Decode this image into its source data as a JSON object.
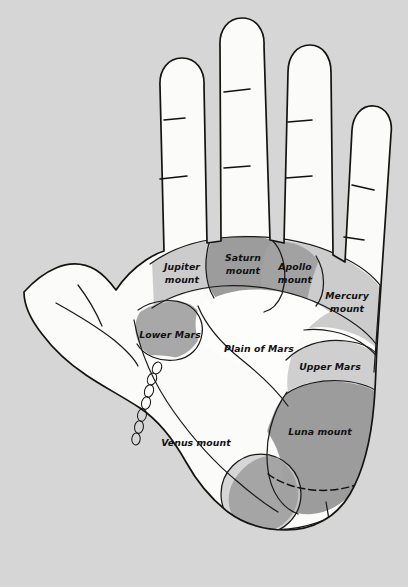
{
  "diagram": {
    "background_color": "#d6d6d6",
    "outline_color": "#15130f",
    "hand": "left palm, fingers up"
  },
  "palette": {
    "background": "#d6d6d6",
    "skin_white": "#fbfbfa",
    "plain_white": "#fdfdfc",
    "light_gray": "#cccccc",
    "medium_gray": "#9c9c9c",
    "dark_outline": "#15130f",
    "label_text": "#111111"
  },
  "regions": [
    {
      "id": "jupiter-mount",
      "label_line1": "Jupiter",
      "label_line2": "mount",
      "shade": "light_gray",
      "color": "#cccccc",
      "cx": 182,
      "cy": 271
    },
    {
      "id": "saturn-mount",
      "label_line1": "Saturn",
      "label_line2": "mount",
      "shade": "medium_gray",
      "color": "#9c9c9c",
      "cx": 243,
      "cy": 262
    },
    {
      "id": "apollo-mount",
      "label_line1": "Apollo",
      "label_line2": "mount",
      "shade": "medium_gray",
      "color": "#a2a2a2",
      "cx": 295,
      "cy": 271
    },
    {
      "id": "mercury-mount",
      "label_line1": "Mercury",
      "label_line2": "mount",
      "shade": "light_gray",
      "color": "#cccccc",
      "cx": 347,
      "cy": 300
    },
    {
      "id": "lower-mars",
      "label_line1": "Lower Mars",
      "label_line2": "",
      "shade": "medium_gray",
      "color": "#a8a8a8",
      "cx": 168,
      "cy": 335
    },
    {
      "id": "upper-mars",
      "label_line1": "Upper Mars",
      "label_line2": "",
      "shade": "light_gray",
      "color": "#cfcfcf",
      "cx": 329,
      "cy": 367
    },
    {
      "id": "plain-of-mars",
      "label_line1": "Plain of Mars",
      "label_line2": "",
      "shade": "plain_white",
      "color": "#fdfdfc",
      "cx": 259,
      "cy": 349
    },
    {
      "id": "luna-mount",
      "label_line1": "Luna mount",
      "label_line2": "",
      "shade": "medium_gray",
      "color": "#9c9c9c",
      "cx": 320,
      "cy": 432
    },
    {
      "id": "venus-mount",
      "label_line1": "Venus mount",
      "label_line2": "",
      "shade": "skin_white",
      "color": "#fbfbfa",
      "cx": 196,
      "cy": 443
    }
  ]
}
